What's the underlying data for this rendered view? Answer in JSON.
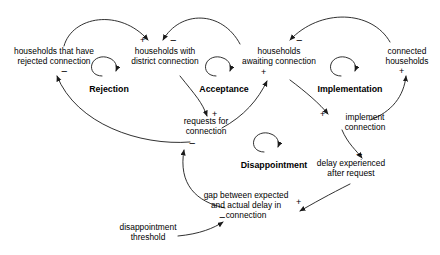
{
  "diagram": {
    "type": "causal-loop-diagram",
    "background_color": "#ffffff",
    "stroke_color": "#1a1a1a",
    "text_color": "#000000"
  },
  "nodes": [
    {
      "id": "rejected",
      "label_line1": "households that have",
      "label_line2": "rejected connection",
      "label_line3": ""
    },
    {
      "id": "district",
      "label_line1": "households with",
      "label_line2": "district connection",
      "label_line3": ""
    },
    {
      "id": "awaiting",
      "label_line1": "households",
      "label_line2": "awaiting connection",
      "label_line3": ""
    },
    {
      "id": "connected",
      "label_line1": "connected",
      "label_line2": "households",
      "label_line3": ""
    },
    {
      "id": "requests",
      "label_line1": "requests for",
      "label_line2": "connection",
      "label_line3": ""
    },
    {
      "id": "implement",
      "label_line1": "implement",
      "label_line2": "connection",
      "label_line3": ""
    },
    {
      "id": "delay",
      "label_line1": "delay experienced",
      "label_line2": "after request",
      "label_line3": ""
    },
    {
      "id": "gap",
      "label_line1": "gap between expected",
      "label_line2": "and actual delay in",
      "label_line3": "connection"
    },
    {
      "id": "threshold",
      "label_line1": "disappointment",
      "label_line2": "threshold",
      "label_line3": ""
    }
  ],
  "loops": [
    {
      "id": "rejection",
      "label": "Rejection"
    },
    {
      "id": "acceptance",
      "label": "Acceptance"
    },
    {
      "id": "implementation",
      "label": "Implementation"
    },
    {
      "id": "disappointment",
      "label": "Disappointment"
    }
  ],
  "signs": [
    {
      "id": "s1",
      "symbol": "+",
      "edge": "rejected-to-district"
    },
    {
      "id": "s2",
      "symbol": "−",
      "edge": "district-to-requests-top"
    },
    {
      "id": "s3",
      "symbol": "−",
      "edge": "awaiting-incoming-top"
    },
    {
      "id": "s4",
      "symbol": "−",
      "edge": "requests-to-rejected"
    },
    {
      "id": "s5",
      "symbol": "+",
      "edge": "district-to-requests"
    },
    {
      "id": "s6",
      "symbol": "+",
      "edge": "requests-to-awaiting"
    },
    {
      "id": "s7",
      "symbol": "+",
      "edge": "awaiting-to-connected"
    },
    {
      "id": "s8",
      "symbol": "+",
      "edge": "awaiting-to-implement"
    },
    {
      "id": "s9",
      "symbol": "−",
      "edge": "implement-to-delay"
    },
    {
      "id": "s10",
      "symbol": "+",
      "edge": "delay-to-gap"
    },
    {
      "id": "s11",
      "symbol": "−",
      "edge": "gap-to-requests"
    },
    {
      "id": "s12",
      "symbol": "−",
      "edge": "threshold-to-gap"
    }
  ]
}
